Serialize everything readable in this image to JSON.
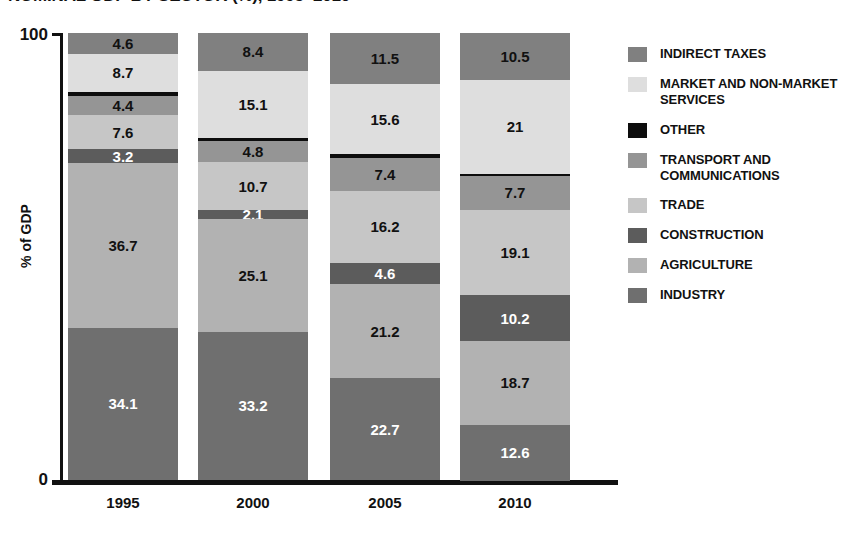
{
  "title": "NOMINAL GDP BY SECTOR (%), 1995–2010",
  "axes": {
    "y_title": "% of GDP",
    "y_ticks": [
      "100",
      "0"
    ],
    "y_top": "100",
    "y_bottom": "0",
    "x_ticks": [
      "1995",
      "2000",
      "2005",
      "2010"
    ]
  },
  "legend": {
    "items": [
      {
        "label": "INDIRECT TAXES",
        "color": "#808080"
      },
      {
        "label": "MARKET AND NON-MARKET SERVICES",
        "color": "#dedede"
      },
      {
        "label": "OTHER",
        "color": "#0d0d0d"
      },
      {
        "label": "TRANSPORT AND COMMUNICATIONS",
        "color": "#959595"
      },
      {
        "label": "TRADE",
        "color": "#c6c6c6"
      },
      {
        "label": "CONSTRUCTION",
        "color": "#5c5c5c"
      },
      {
        "label": "AGRICULTURE",
        "color": "#b2b2b2"
      },
      {
        "label": "INDUSTRY",
        "color": "#6f6f6f"
      }
    ]
  },
  "chart_data": {
    "type": "bar",
    "stacked": true,
    "title": "NOMINAL GDP BY SECTOR (%), 1995–2010",
    "xlabel": "",
    "ylabel": "% of GDP",
    "ylim": [
      0,
      100
    ],
    "grid": false,
    "legend_position": "right",
    "categories": [
      "1995",
      "2000",
      "2005",
      "2010"
    ],
    "series": [
      {
        "name": "INDUSTRY",
        "color": "#6f6f6f",
        "text_color": "#ffffff",
        "values": [
          34.1,
          33.2,
          22.7,
          12.6
        ],
        "labels": [
          "34.1",
          "33.2",
          "22.7",
          "12.6"
        ]
      },
      {
        "name": "AGRICULTURE",
        "color": "#b2b2b2",
        "text_color": "#111111",
        "values": [
          36.7,
          25.1,
          21.2,
          18.7
        ],
        "labels": [
          "36.7",
          "25.1",
          "21.2",
          "18.7"
        ]
      },
      {
        "name": "CONSTRUCTION",
        "color": "#5c5c5c",
        "text_color": "#ffffff",
        "values": [
          3.2,
          2.1,
          4.6,
          10.2
        ],
        "labels": [
          "3.2",
          "2.1",
          "4.6",
          "10.2"
        ]
      },
      {
        "name": "TRADE",
        "color": "#c6c6c6",
        "text_color": "#111111",
        "values": [
          7.6,
          10.7,
          16.2,
          19.1
        ],
        "labels": [
          "7.6",
          "10.7",
          "16.2",
          "19.1"
        ]
      },
      {
        "name": "TRANSPORT AND COMMUNICATIONS",
        "color": "#959595",
        "text_color": "#111111",
        "values": [
          4.4,
          4.8,
          7.4,
          7.7
        ],
        "labels": [
          "4.4",
          "4.8",
          "7.4",
          "7.7"
        ]
      },
      {
        "name": "OTHER",
        "color": "#0d0d0d",
        "text_color": "#ffffff",
        "values": [
          0.7,
          0.6,
          0.8,
          0.4
        ],
        "labels": [
          "",
          "",
          "",
          ""
        ]
      },
      {
        "name": "MARKET AND NON-MARKET SERVICES",
        "color": "#dedede",
        "text_color": "#111111",
        "values": [
          8.7,
          15.1,
          15.6,
          21.0
        ],
        "labels": [
          "8.7",
          "15.1",
          "15.6",
          "21"
        ]
      },
      {
        "name": "INDIRECT TAXES",
        "color": "#808080",
        "text_color": "#111111",
        "values": [
          4.6,
          8.4,
          11.5,
          10.5
        ],
        "labels": [
          "4.6",
          "8.4",
          "11.5",
          "10.5"
        ]
      }
    ]
  },
  "layout": {
    "bar_left_positions": [
      68,
      198,
      330,
      460
    ],
    "bar_width": 110
  }
}
